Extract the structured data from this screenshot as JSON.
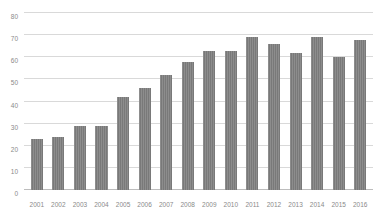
{
  "chart_data": {
    "type": "bar",
    "title": "",
    "xlabel": "",
    "ylabel": "",
    "categories": [
      "2001",
      "2002",
      "2003",
      "2004",
      "2005",
      "2006",
      "2007",
      "2008",
      "2009",
      "2010",
      "2011",
      "2012",
      "2013",
      "2014",
      "2015",
      "2016"
    ],
    "values": [
      23,
      24,
      29,
      29,
      42,
      46,
      52,
      58,
      63,
      63,
      69,
      66,
      62,
      69,
      60,
      68
    ],
    "ylim": [
      0,
      80
    ],
    "yticks": [
      0,
      10,
      20,
      30,
      40,
      50,
      60,
      70,
      80
    ],
    "ytick_labels": [
      "0",
      "10",
      "20",
      "30",
      "40",
      "50",
      "60",
      "70",
      "80"
    ],
    "grid": true,
    "legend": false,
    "series_color": "#7f7f7f",
    "gridline_color": "#d9d9d9",
    "label_color": "#8a8a8a"
  }
}
